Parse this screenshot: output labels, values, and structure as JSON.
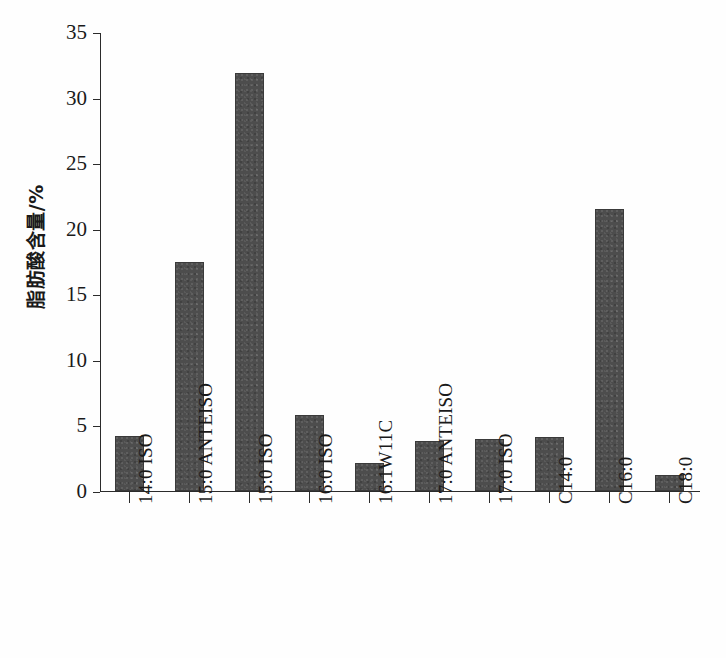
{
  "chart_data": {
    "type": "bar",
    "title": "",
    "xlabel": "",
    "ylabel": "脂肪酸含量/%",
    "ylim": [
      0,
      35
    ],
    "ytick_values": [
      0,
      5,
      10,
      15,
      20,
      25,
      30,
      35
    ],
    "ytick_labels": [
      "0",
      "5",
      "10",
      "15",
      "20",
      "25",
      "30",
      "35"
    ],
    "grid": false,
    "legend": false,
    "bar_color": "#4d4d4d",
    "axis_color": "#2b2b2b",
    "background_color": "#fefefe",
    "categories": [
      "14:0 ISO",
      "15:0 ANTEISO",
      "15:0 ISO",
      "16:0 ISO",
      "16:1W11C",
      "17:0 ANTEISO",
      "17:0 ISO",
      "C14:0",
      "C16:0",
      "C18:0"
    ],
    "values": [
      4.2,
      17.5,
      31.9,
      5.8,
      2.1,
      3.8,
      4.0,
      4.1,
      21.5,
      1.2
    ]
  }
}
